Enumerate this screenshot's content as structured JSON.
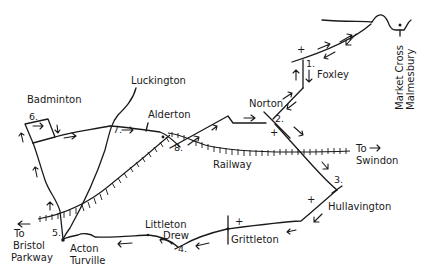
{
  "map": {
    "title": "Hand-drawn walking route map: Malmesbury area",
    "places": [
      {
        "name": "Badminton",
        "x": 27,
        "y": 103
      },
      {
        "name": "Luckington",
        "x": 131,
        "y": 82
      },
      {
        "name": "Alderton",
        "x": 148,
        "y": 117
      },
      {
        "name": "Norton",
        "x": 245,
        "y": 103
      },
      {
        "name": "Foxley",
        "x": 317,
        "y": 76
      },
      {
        "name": "Railway",
        "x": 212,
        "y": 148
      },
      {
        "name": "Hullavington",
        "x": 328,
        "y": 209
      },
      {
        "name": "Grittleton",
        "x": 232,
        "y": 242
      },
      {
        "name": "Littleton",
        "x": 145,
        "y": 227
      },
      {
        "name": "Drew",
        "x": 163,
        "y": 238
      },
      {
        "name": "Acton",
        "x": 70,
        "y": 251
      },
      {
        "name": "Turville",
        "x": 70,
        "y": 264
      }
    ],
    "directions": [
      {
        "line1": "To",
        "line2": "Swindon",
        "x": 356,
        "y": 152
      },
      {
        "line1": "To",
        "line2": "Bristol",
        "line3": "Parkway",
        "x": 13,
        "y": 247
      }
    ],
    "landmark": {
      "line1": "Market Cross",
      "line2": "Malmesbury"
    },
    "waypoints": [
      {
        "label": "1.",
        "x": 306,
        "y": 66
      },
      {
        "label": "2.",
        "x": 276,
        "y": 121
      },
      {
        "label": "3.",
        "x": 335,
        "y": 183
      },
      {
        "label": "4.",
        "x": 178,
        "y": 251
      },
      {
        "label": "5.",
        "x": 51,
        "y": 235
      },
      {
        "label": "6.",
        "x": 30,
        "y": 120
      },
      {
        "label": "7.",
        "x": 114,
        "y": 131
      },
      {
        "label": "8.",
        "x": 175,
        "y": 150
      }
    ],
    "church_markers": [
      "+",
      "+",
      "+",
      "+",
      "+"
    ],
    "colors": {
      "ink": "#1a1a1a",
      "paper": "#ffffff"
    }
  }
}
